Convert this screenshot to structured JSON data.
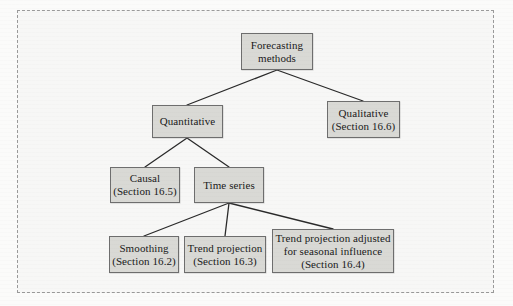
{
  "figure": {
    "type": "hierarchy-tree-diagram",
    "background_color": "#f7f7f6",
    "border_color": "#9a9a9a",
    "node_fill_color": "#d9d9d5",
    "node_border_color": "#6e6e6e",
    "connector_color": "#2a2a2a"
  },
  "nodes": {
    "forecasting_methods": {
      "lines": [
        "Forecasting",
        "methods"
      ]
    },
    "quantitative": {
      "lines": [
        "Quantitative"
      ]
    },
    "qualitative": {
      "lines": [
        "Qualitative",
        "(Section 16.6)"
      ]
    },
    "causal": {
      "lines": [
        "Causal",
        "(Section 16.5)"
      ]
    },
    "time_series": {
      "lines": [
        "Time series"
      ]
    },
    "smoothing": {
      "lines": [
        "Smoothing",
        "(Section 16.2)"
      ]
    },
    "trend_projection": {
      "lines": [
        "Trend projection",
        "(Section 16.3)"
      ]
    },
    "trend_seasonal": {
      "lines": [
        "Trend projection adjusted",
        "for seasonal influence",
        "(Section 16.4)"
      ]
    }
  }
}
